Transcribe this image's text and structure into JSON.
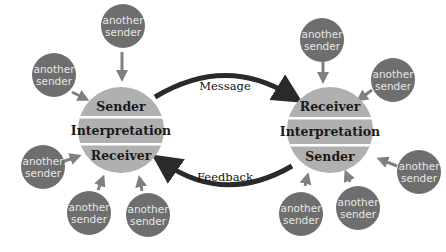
{
  "colors": {
    "main_circle": "#b0b0b0",
    "band_separator": "#ffffff",
    "small_circle": "#6e6e6e",
    "small_text": "#e6e6e6",
    "small_arrow": "#808080",
    "big_arrow": "#2a2a2a"
  },
  "left_node": {
    "top": "Sender",
    "middle": "Interpretation",
    "bottom": "Receiver"
  },
  "right_node": {
    "top": "Receiver",
    "middle": "Interpretation",
    "bottom": "Sender"
  },
  "arrows": {
    "top_label": "Message",
    "bottom_label": "Feedback"
  },
  "small_nodes": {
    "line1": "another",
    "line2": "sender"
  }
}
